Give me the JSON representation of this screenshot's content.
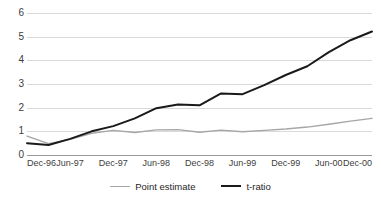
{
  "chart_data": {
    "type": "line",
    "title": "",
    "subtitle": "",
    "xlabel": "",
    "ylabel": "",
    "ylim": [
      0,
      6
    ],
    "yticks": [
      0,
      1,
      2,
      3,
      4,
      5,
      6
    ],
    "ytick_labels": [
      "0",
      "1",
      "2",
      "3",
      "4",
      "5",
      "6"
    ],
    "grid": true,
    "grid_axis": "y",
    "legend_position": "bottom",
    "x_tick_labels": [
      "Dec-96",
      "Jun-97",
      "Dec-97",
      "Jun-98",
      "Dec-98",
      "Jun-99",
      "Dec-99",
      "Jun-00",
      "Dec-00"
    ],
    "x": [
      "Dec-96",
      "Mar-97",
      "Jun-97",
      "Sep-97",
      "Dec-97",
      "Mar-98",
      "Jun-98",
      "Sep-98",
      "Dec-98",
      "Mar-99",
      "Jun-99",
      "Sep-99",
      "Dec-99",
      "Mar-00",
      "Jun-00",
      "Sep-00",
      "Dec-00"
    ],
    "series": [
      {
        "name": "Point estimate",
        "color": "#a6a6a6",
        "width": 1.4,
        "values": [
          0.8,
          0.48,
          0.66,
          0.92,
          1.04,
          0.95,
          1.06,
          1.07,
          0.96,
          1.05,
          0.98,
          1.04,
          1.1,
          1.18,
          1.3,
          1.43,
          1.55
        ]
      },
      {
        "name": "t-ratio",
        "color": "#1a1a1a",
        "width": 2.0,
        "values": [
          0.5,
          0.42,
          0.68,
          1.0,
          1.22,
          1.55,
          1.98,
          2.13,
          2.1,
          2.6,
          2.57,
          2.95,
          3.38,
          3.75,
          4.35,
          4.85,
          5.22
        ]
      }
    ]
  },
  "legend": {
    "items": [
      {
        "label": "Point estimate",
        "color": "#a6a6a6",
        "width": 1.5
      },
      {
        "label": "t-ratio",
        "color": "#1a1a1a",
        "width": 2.2
      }
    ]
  }
}
